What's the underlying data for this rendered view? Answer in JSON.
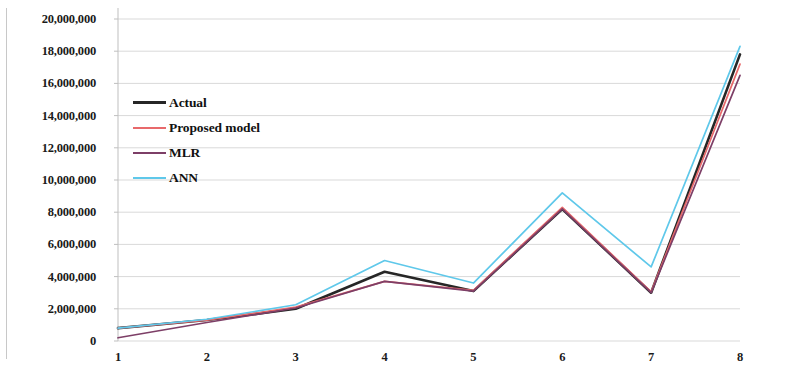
{
  "chart_data": {
    "type": "line",
    "title": "",
    "subtitle": "",
    "xlabel": "",
    "ylabel": "",
    "x": [
      1,
      2,
      3,
      4,
      5,
      6,
      7,
      8
    ],
    "categories": [
      "1",
      "2",
      "3",
      "4",
      "5",
      "6",
      "7",
      "8"
    ],
    "xlim": [
      1,
      8
    ],
    "ylim": [
      0,
      20000000
    ],
    "grid": true,
    "grid_axis": "y",
    "legend_position": "inside-upper-left",
    "y_tick_labels": [
      "20,000,000",
      "18,000,000",
      "16,000,000",
      "14,000,000",
      "12,000,000",
      "10,000,000",
      "8,000,000",
      "6,000,000",
      "4,000,000",
      "2,000,000",
      "0"
    ],
    "y_tick_values": [
      20000000,
      18000000,
      16000000,
      14000000,
      12000000,
      10000000,
      8000000,
      6000000,
      4000000,
      2000000,
      0
    ],
    "x_tick_labels": [
      "1",
      "2",
      "3",
      "4",
      "5",
      "6",
      "7",
      "8"
    ],
    "series": [
      {
        "name": "Actual",
        "color": "#262626",
        "width": 2.6,
        "values": [
          800000,
          1300000,
          2000000,
          4300000,
          3100000,
          8200000,
          3000000,
          17800000
        ]
      },
      {
        "name": "Proposed model",
        "color": "#e8696b",
        "width": 1.7,
        "values": [
          800000,
          1300000,
          2100000,
          3700000,
          3150000,
          8300000,
          3050000,
          17200000
        ]
      },
      {
        "name": "MLR",
        "color": "#7d3f67",
        "width": 1.7,
        "values": [
          200000,
          1150000,
          2050000,
          3700000,
          3100000,
          8200000,
          3000000,
          16500000
        ]
      },
      {
        "name": "ANN",
        "color": "#5fc8ea",
        "width": 1.7,
        "values": [
          800000,
          1350000,
          2250000,
          5000000,
          3600000,
          9200000,
          4600000,
          18300000
        ]
      }
    ]
  },
  "legend": {
    "items": [
      {
        "label": "Actual",
        "color": "#262626"
      },
      {
        "label": "Proposed model",
        "color": "#e8696b"
      },
      {
        "label": "MLR",
        "color": "#7d3f67"
      },
      {
        "label": "ANN",
        "color": "#5fc8ea"
      }
    ]
  },
  "axes": {
    "y_axis_name": "value-axis",
    "x_axis_name": "index-axis"
  },
  "colors": {
    "gridline": "#d9d9d9",
    "axis": "#bfbfbf",
    "background": "#ffffff",
    "tick_text": "#1a1a1a"
  }
}
